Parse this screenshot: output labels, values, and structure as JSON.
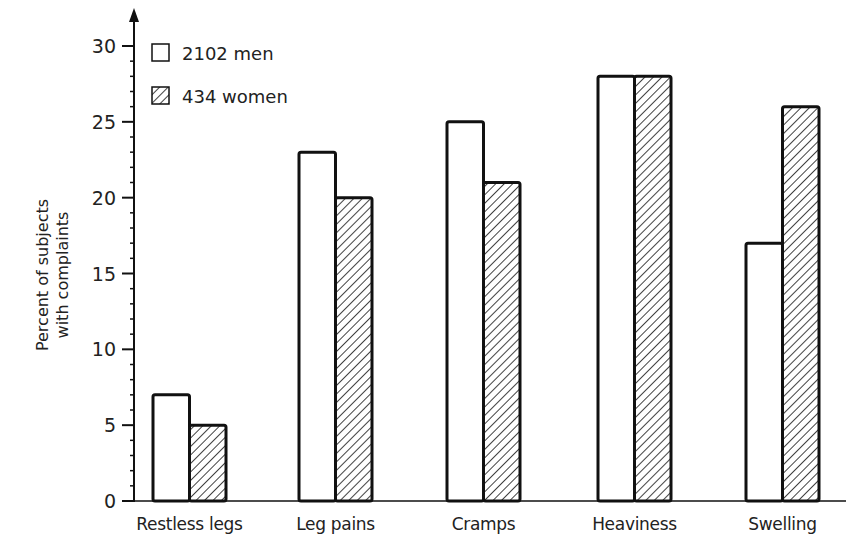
{
  "chart_data": {
    "type": "bar",
    "title": "",
    "xlabel": "",
    "ylabel": "Percent of subjects with complaints",
    "ylabel_lines": [
      "Percent of subjects",
      "with complaints"
    ],
    "ylim": [
      0,
      30
    ],
    "yticks": [
      0,
      5,
      10,
      15,
      20,
      25,
      30
    ],
    "minor_tick_step": 1,
    "grid": false,
    "legend_position": "upper-left",
    "categories": [
      "Restless legs",
      "Leg pains",
      "Cramps",
      "Heaviness",
      "Swelling"
    ],
    "series": [
      {
        "name": "2102 men",
        "pattern": "open",
        "values": [
          7,
          23,
          25,
          28,
          17
        ]
      },
      {
        "name": "434 women",
        "pattern": "hatched",
        "values": [
          5,
          20,
          21,
          28,
          26
        ]
      }
    ]
  },
  "colors": {
    "ink": "#111111",
    "background": "#ffffff"
  }
}
